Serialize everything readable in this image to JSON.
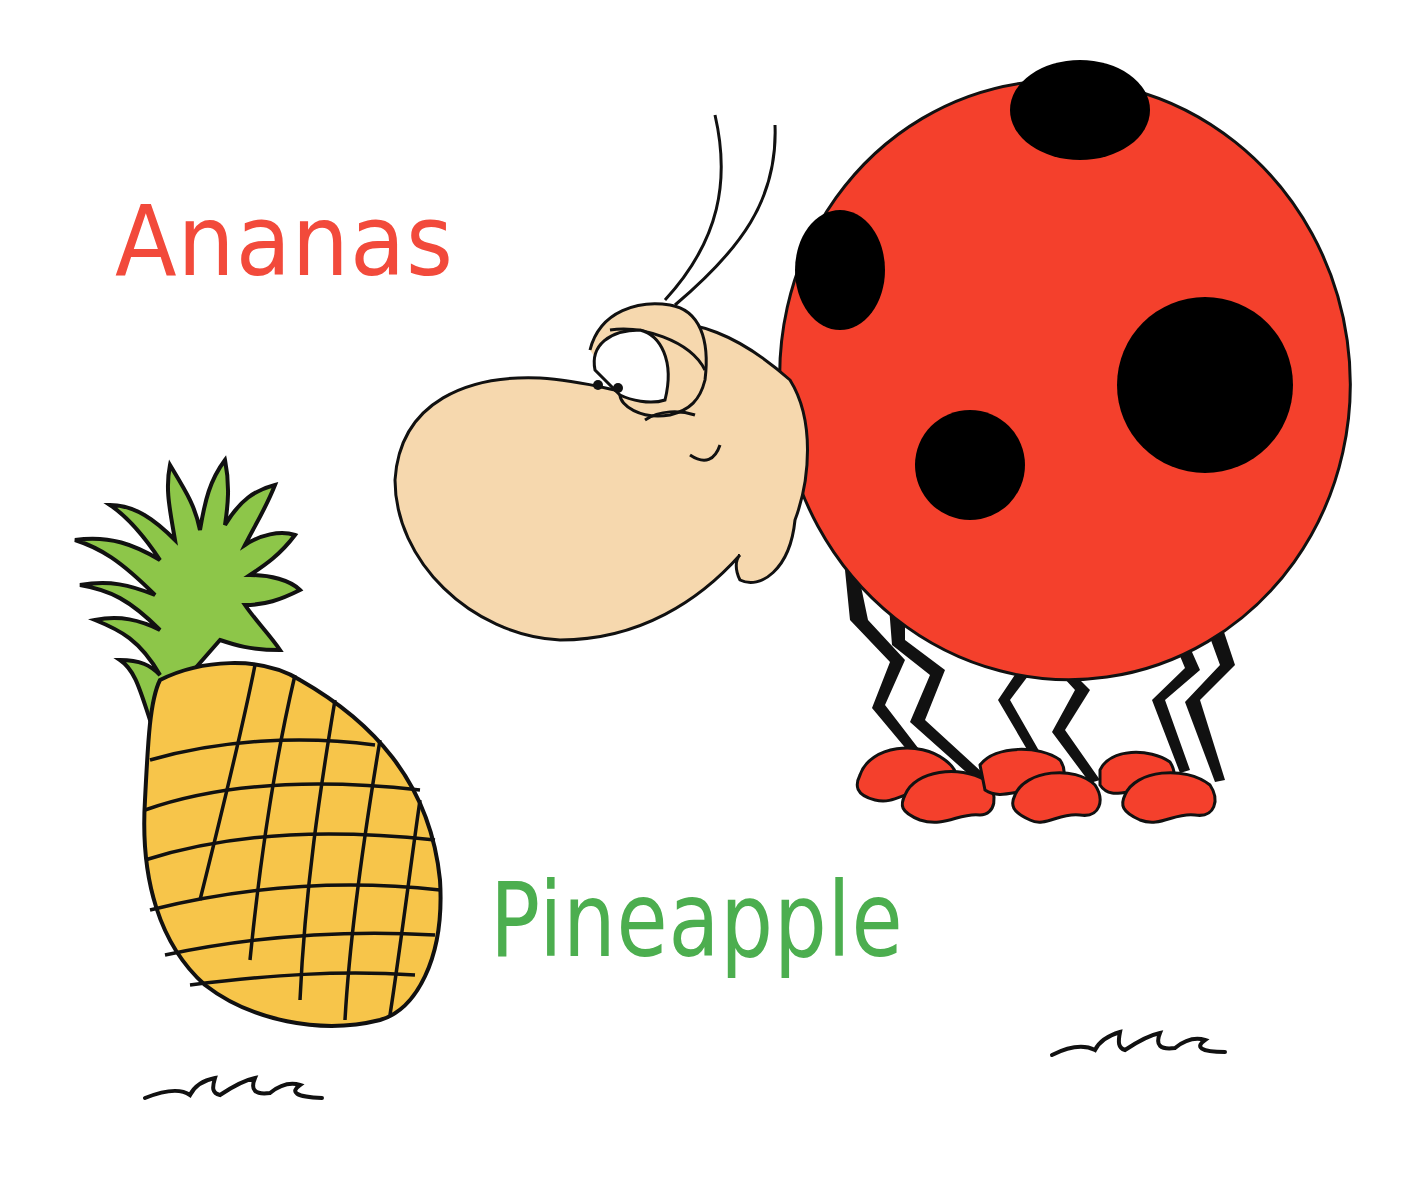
{
  "labels": {
    "foreign_word": "Ananas",
    "english_word": "Pineapple"
  },
  "colors": {
    "foreign_word": "#f24a3b",
    "english_word": "#4cae4f",
    "ladybug_body": "#f4402c",
    "ladybug_spots": "#000000",
    "ladybug_face": "#f6d8ae",
    "pineapple_fruit": "#f7c54a",
    "pineapple_leaves": "#8dc649",
    "outline": "#111111"
  },
  "illustrations": [
    {
      "name": "ladybug",
      "description": "Cartoon ladybug with red spotted body, beige face, two antennae, six zigzag black legs and red feet"
    },
    {
      "name": "pineapple",
      "description": "Yellow pineapple with crosshatched diamond pattern and green leafy crown"
    },
    {
      "name": "grass-tuft-left"
    },
    {
      "name": "grass-tuft-right"
    }
  ]
}
